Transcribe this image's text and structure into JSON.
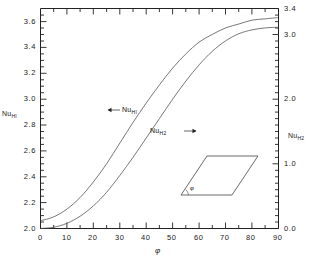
{
  "chart_data": {
    "type": "line",
    "title": "",
    "subtitle": "",
    "xlabel": "φ",
    "ylabel": "Nu HI",
    "ylabel_right": "Nu H2",
    "xlim": [
      0,
      90
    ],
    "ylim": [
      2.0,
      3.7
    ],
    "ylim_right": [
      0.0,
      3.4
    ],
    "grid": false,
    "legend_position": "inline-annotations",
    "x_ticks": [
      0,
      10,
      20,
      30,
      40,
      50,
      60,
      70,
      80,
      90
    ],
    "x_tick_labels": [
      "0",
      "10",
      "20",
      "30",
      "40",
      "50",
      "60",
      "70",
      "80",
      "90"
    ],
    "x_minor_step": 5,
    "y_ticks_left": [
      2.0,
      2.2,
      2.4,
      2.6,
      2.8,
      3.0,
      3.2,
      3.4,
      3.6
    ],
    "y_tick_labels_left": [
      "2,0",
      "2,2",
      "2,4",
      "2,6",
      "2,8",
      "3,0",
      "3,4",
      "3,4",
      "3,6"
    ],
    "y_tick_labels_left_display": [
      "2.0",
      "2.2",
      "2.4",
      "2.6",
      "2.8",
      "3.0",
      "3.2",
      "3.4",
      "3.6"
    ],
    "y_minor_step_left": 0.05,
    "y_ticks_right": [
      0.0,
      1.0,
      2.0,
      3.0,
      3.4
    ],
    "y_tick_labels_right": [
      "0.0",
      "1.0",
      "2.0",
      "3.0",
      "3.4"
    ],
    "y_minor_step_right": 0.1,
    "series": [
      {
        "name": "Nu HI",
        "axis": "left",
        "annotation": "Nu",
        "annotation_sub": "HI",
        "arrow": "left",
        "x": [
          0,
          5,
          10,
          15,
          20,
          25,
          30,
          35,
          40,
          45,
          50,
          55,
          60,
          65,
          70,
          75,
          80,
          85,
          90
        ],
        "values": [
          2.06,
          2.09,
          2.15,
          2.24,
          2.36,
          2.5,
          2.66,
          2.82,
          2.97,
          3.11,
          3.24,
          3.35,
          3.44,
          3.5,
          3.55,
          3.58,
          3.61,
          3.62,
          3.63
        ]
      },
      {
        "name": "Nu H2",
        "axis": "right",
        "annotation": "Nu",
        "annotation_sub": "H2",
        "arrow": "right",
        "x": [
          0,
          5,
          10,
          15,
          20,
          25,
          30,
          35,
          40,
          45,
          50,
          55,
          60,
          65,
          70,
          75,
          80,
          85,
          90
        ],
        "values": [
          0.0,
          0.02,
          0.08,
          0.19,
          0.35,
          0.56,
          0.82,
          1.1,
          1.4,
          1.7,
          2.0,
          2.28,
          2.53,
          2.74,
          2.9,
          3.01,
          3.07,
          3.1,
          3.11
        ]
      }
    ],
    "annotations": [
      {
        "text": "Nu",
        "sub": "HI",
        "arrow": "left"
      },
      {
        "text": "Nu",
        "sub": "H2",
        "arrow": "right"
      }
    ],
    "inset": {
      "shape": "parallelogram",
      "angle_label": "φ",
      "description": "rhombic duct cross-section with apex angle phi"
    }
  },
  "axes": {
    "left_title_main": "Nu",
    "left_title_sub": "HI",
    "right_title_main": "Nu",
    "right_title_sub": "H2",
    "x_title": "φ"
  }
}
